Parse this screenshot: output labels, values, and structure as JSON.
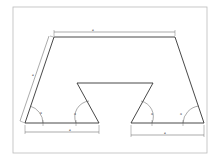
{
  "diagram": {
    "type": "technical-drawing",
    "colors": {
      "stroke": "#333333",
      "dimension": "#555555",
      "frame": "#bbbbbb",
      "background": "#ffffff"
    },
    "labels": {
      "top_width": "a",
      "left_side": "a",
      "bottom_left_width": "a",
      "bottom_right_width": "a",
      "angle_outer_left": "α",
      "angle_notch_left": "α",
      "angle_notch_right": "α",
      "angle_outer_right": "α"
    }
  }
}
